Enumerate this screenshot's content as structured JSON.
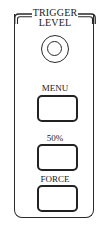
{
  "panel": {
    "title_line1": "TRIGGER",
    "title_line2": "LEVEL",
    "knob": {
      "name": "trigger-level-knob",
      "icon": "rotary-knob-icon"
    },
    "buttons": [
      {
        "label": "MENU"
      },
      {
        "label": "50%"
      },
      {
        "label": "FORCE"
      }
    ]
  },
  "colors": {
    "stroke": "#2a2a2a",
    "background": "#ffffff"
  }
}
